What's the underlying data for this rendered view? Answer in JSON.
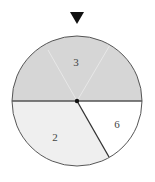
{
  "spinner": {
    "pointer": "triangle-down",
    "center": [
      77,
      101
    ],
    "radius": 65,
    "colors": {
      "top": "#d6d6d6",
      "left": "#efefef",
      "right": "#ffffff",
      "outline": "#555555",
      "pointer": "#111111"
    },
    "sectors": [
      {
        "label": "3",
        "region": "top-half"
      },
      {
        "label": "2",
        "region": "bottom-left"
      },
      {
        "label": "6",
        "region": "bottom-right"
      }
    ]
  }
}
